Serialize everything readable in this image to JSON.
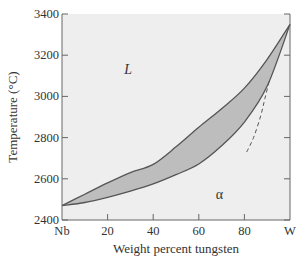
{
  "chart_data": {
    "type": "line",
    "title": "",
    "xlabel": "Weight percent tungsten",
    "ylabel": "Temperature (°C)",
    "xlim": [
      0,
      100
    ],
    "ylim": [
      2400,
      3400
    ],
    "x_ticks": [
      {
        "value": 0,
        "label": "Nb"
      },
      {
        "value": 20,
        "label": "20"
      },
      {
        "value": 40,
        "label": "40"
      },
      {
        "value": 60,
        "label": "60"
      },
      {
        "value": 80,
        "label": "80"
      },
      {
        "value": 100,
        "label": "W"
      }
    ],
    "y_ticks": [
      {
        "value": 2400,
        "label": "2400"
      },
      {
        "value": 2600,
        "label": "2600"
      },
      {
        "value": 2800,
        "label": "2800"
      },
      {
        "value": 3000,
        "label": "3000"
      },
      {
        "value": 3200,
        "label": "3200"
      },
      {
        "value": 3400,
        "label": "3400"
      }
    ],
    "grid": false,
    "series": [
      {
        "name": "liquidus",
        "style": "solid",
        "x": [
          0,
          10,
          20,
          30,
          40,
          50,
          60,
          70,
          80,
          90,
          100
        ],
        "y": [
          2470,
          2525,
          2580,
          2630,
          2670,
          2755,
          2850,
          2940,
          3040,
          3180,
          3350
        ]
      },
      {
        "name": "solidus",
        "style": "solid",
        "x": [
          0,
          10,
          20,
          30,
          40,
          50,
          60,
          70,
          80,
          90,
          100
        ],
        "y": [
          2470,
          2485,
          2510,
          2540,
          2575,
          2620,
          2672,
          2760,
          2875,
          3050,
          3350
        ]
      },
      {
        "name": "dashed-boundary",
        "style": "dashed",
        "x": [
          81,
          84,
          87,
          89,
          91
        ],
        "y": [
          2730,
          2800,
          2900,
          2990,
          3080
        ]
      }
    ],
    "shaded_region": {
      "between": [
        "liquidus",
        "solidus"
      ],
      "label": "L + α two-phase region"
    },
    "annotations": [
      {
        "text": "L",
        "x": 29,
        "y": 3110,
        "italic": true
      },
      {
        "text": "α",
        "x": 69,
        "y": 2500,
        "italic": false
      }
    ],
    "colors": {
      "plot_background": "#eeeeee",
      "band_fill": "#bdbdbd",
      "curve": "#555555",
      "axis": "#666666"
    }
  }
}
